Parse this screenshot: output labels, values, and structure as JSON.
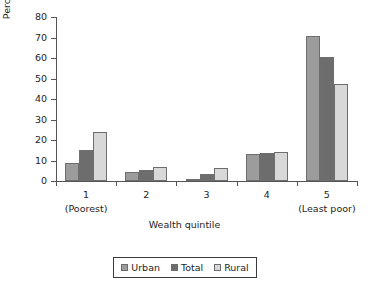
{
  "chart_data": {
    "type": "bar",
    "title": "",
    "subtitle": "",
    "xlabel": "Wealth quintile",
    "ylabel": "Percentage of residents",
    "categories": [
      "1",
      "2",
      "3",
      "4",
      "5"
    ],
    "category_sublabels": [
      "(Poorest)",
      "",
      "",
      "",
      "(Least poor)"
    ],
    "series": [
      {
        "name": "Urban",
        "color": "#9c9c9c",
        "values": [
          9,
          4.5,
          1,
          13.2,
          70.5
        ]
      },
      {
        "name": "Total",
        "color": "#6d6d6d",
        "values": [
          15.3,
          5.3,
          3.3,
          13.5,
          60.5
        ]
      },
      {
        "name": "Rural",
        "color": "#d8d8d8",
        "values": [
          23.8,
          7,
          6.3,
          14.2,
          47.5
        ]
      }
    ],
    "ylim": [
      0,
      80
    ],
    "yticks": [
      0,
      10,
      20,
      30,
      40,
      50,
      60,
      70,
      80
    ],
    "ytick_labels": [
      "0",
      "10",
      "20",
      "30",
      "40",
      "50",
      "60",
      "70",
      "80"
    ],
    "grid": false,
    "legend_position": "bottom",
    "legend_entries": [
      "Urban",
      "Total",
      "Rural"
    ]
  }
}
